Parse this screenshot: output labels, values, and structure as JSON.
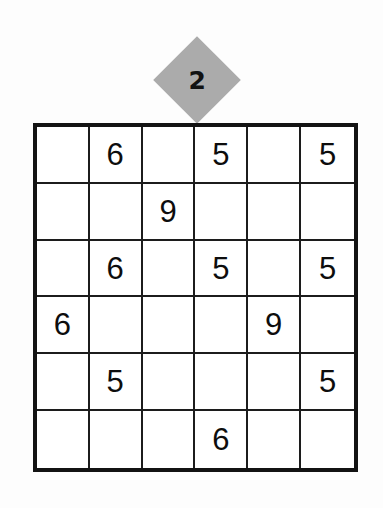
{
  "page": {
    "background_color": "#fdfdfd",
    "type": "sudoku-puzzle"
  },
  "badge": {
    "shape": "diamond",
    "label": "2",
    "fill_color": "#ababab",
    "text_color": "#121212"
  },
  "grid": {
    "rows": 6,
    "columns": 6,
    "border_color": "#131313",
    "line_color": "#1c1c1c",
    "cell_background": "#ffffff",
    "digit_color": "#0d0d0d",
    "cells": [
      [
        "",
        "6",
        "",
        "5",
        "",
        "5"
      ],
      [
        "",
        "",
        "9",
        "",
        "",
        ""
      ],
      [
        "",
        "6",
        "",
        "5",
        "",
        "5"
      ],
      [
        "6",
        "",
        "",
        "",
        "9",
        ""
      ],
      [
        "",
        "5",
        "",
        "",
        "",
        "5"
      ],
      [
        "",
        "",
        "",
        "6",
        "",
        ""
      ]
    ]
  }
}
